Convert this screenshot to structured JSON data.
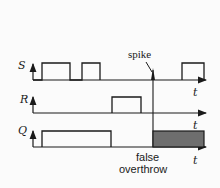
{
  "diagram": {
    "type": "timing-diagram",
    "signals": [
      {
        "name": "S",
        "axis_label": "t",
        "pulses": [
          [
            42,
            70
          ],
          [
            82,
            100
          ],
          [
            182,
            204
          ]
        ]
      },
      {
        "name": "R",
        "axis_label": "t",
        "pulses": [
          [
            112,
            141
          ]
        ]
      },
      {
        "name": "Q",
        "axis_label": "t",
        "pulses": [
          [
            42,
            111
          ]
        ],
        "shaded_region": [
          153,
          204
        ]
      }
    ],
    "annotations": {
      "spike": "spike",
      "false_line1": "false",
      "false_line2": "overthrow"
    },
    "colors": {
      "line": "#1a1a1a",
      "shade": "#6e6e6e",
      "background": "#fbfbfb"
    }
  }
}
